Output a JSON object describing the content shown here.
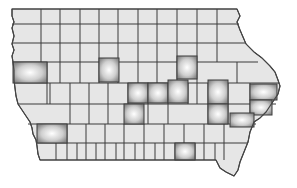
{
  "map": {
    "title": "Iowa counties",
    "base_color": "#e6e6e6",
    "border_color": "#3a3a3a",
    "highlight_center": "#ffffff",
    "highlight_edge": "#8a8a8a",
    "highlighted_counties": [
      {
        "name": "Monona",
        "x": 13,
        "y": 62,
        "w": 34,
        "h": 21
      },
      {
        "name": "Webster",
        "x": 99,
        "y": 58,
        "w": 20,
        "h": 24
      },
      {
        "name": "Black Hawk",
        "x": 177,
        "y": 56,
        "w": 20,
        "h": 23
      },
      {
        "name": "Story",
        "x": 128,
        "y": 83,
        "w": 20,
        "h": 20
      },
      {
        "name": "Marshall",
        "x": 148,
        "y": 83,
        "w": 20,
        "h": 20
      },
      {
        "name": "Tama",
        "x": 168,
        "y": 80,
        "w": 20,
        "h": 23
      },
      {
        "name": "Linn",
        "x": 208,
        "y": 80,
        "w": 20,
        "h": 24
      },
      {
        "name": "Jackson",
        "x": 250,
        "y": 84,
        "w": 27,
        "h": 16
      },
      {
        "name": "Johnson",
        "x": 208,
        "y": 104,
        "w": 20,
        "h": 20
      },
      {
        "name": "Scott",
        "x": 250,
        "y": 100,
        "w": 22,
        "h": 15
      },
      {
        "name": "Muscatine",
        "x": 230,
        "y": 113,
        "w": 24,
        "h": 14
      },
      {
        "name": "Polk",
        "x": 124,
        "y": 104,
        "w": 20,
        "h": 20
      },
      {
        "name": "Pottawattamie",
        "x": 37,
        "y": 124,
        "w": 30,
        "h": 19
      },
      {
        "name": "Monroe",
        "x": 175,
        "y": 143,
        "w": 20,
        "h": 17
      }
    ]
  }
}
